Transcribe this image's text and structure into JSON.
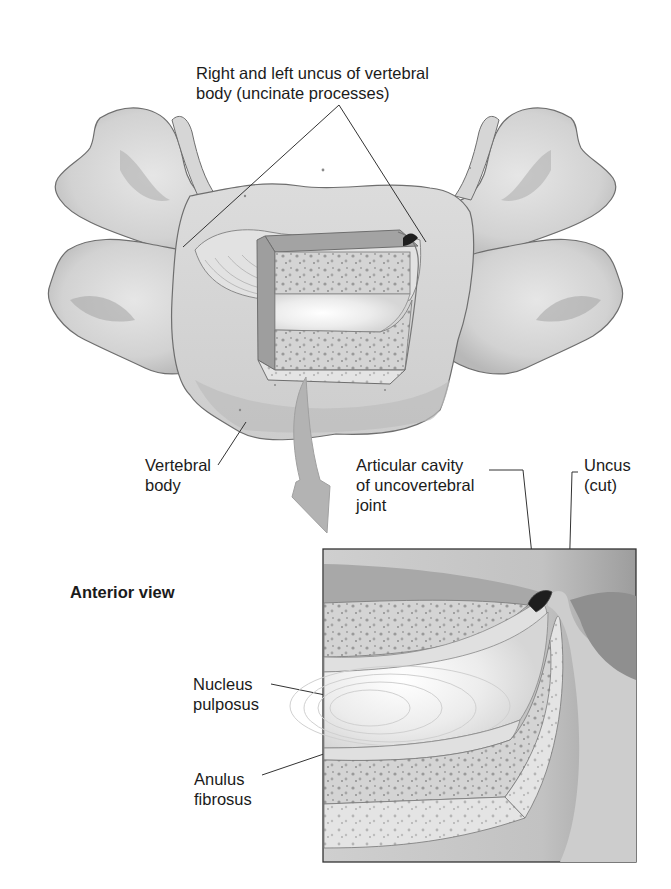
{
  "figure": {
    "view_label": "Anterior view",
    "labels": {
      "uncus_pair": [
        "Right and left uncus of vertebral",
        "body (uncinate processes)"
      ],
      "vertebral_body": [
        "Vertebral",
        "body"
      ],
      "articular_cavity": [
        "Articular cavity",
        "of uncovertebral",
        "joint"
      ],
      "uncus_cut": [
        "Uncus",
        "(cut)"
      ],
      "nucleus_pulposus": [
        "Nucleus",
        "pulposus"
      ],
      "anulus_fibrosus": [
        "Anulus",
        "fibrosus"
      ]
    },
    "colors": {
      "bone_light": "#d9d9d9",
      "bone_mid": "#bdbdbd",
      "bone_dark": "#8e8e8e",
      "outline": "#6e6e6e",
      "arrow": "#b3b3b3",
      "nucleus": "#f4f4f4",
      "cavity": "#1e1e1e",
      "leader": "#333333"
    }
  }
}
